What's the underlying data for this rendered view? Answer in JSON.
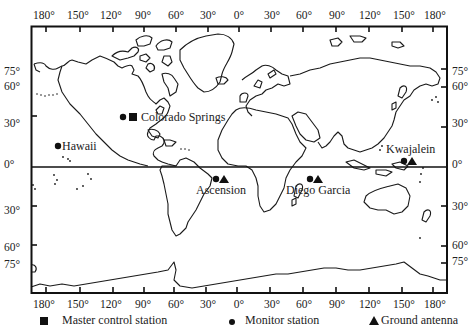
{
  "map": {
    "longitude_labels": [
      "180°",
      "150°",
      "120°",
      "90°",
      "60°",
      "30°",
      "0°",
      "30°",
      "60°",
      "90°",
      "120°",
      "150°",
      "180°"
    ],
    "latitude_labels_left": [
      {
        "label": "75°",
        "y": 72
      },
      {
        "label": "60°",
        "y": 87
      },
      {
        "label": "30°",
        "y": 124
      },
      {
        "label": "0°",
        "y": 165
      },
      {
        "label": "30°",
        "y": 211
      },
      {
        "label": "60°",
        "y": 248
      },
      {
        "label": "75°",
        "y": 265
      }
    ],
    "latitude_labels_right": [
      {
        "label": "75°",
        "y": 72
      },
      {
        "label": "60°",
        "y": 87
      },
      {
        "label": "30°",
        "y": 124
      },
      {
        "label": "0°",
        "y": 165
      },
      {
        "label": "30°",
        "y": 207
      },
      {
        "label": "60°",
        "y": 246
      },
      {
        "label": "75°",
        "y": 262
      }
    ],
    "stations": [
      {
        "name": "Colorado Springs",
        "types": [
          "monitor",
          "master"
        ]
      },
      {
        "name": "Hawaii",
        "types": [
          "monitor"
        ]
      },
      {
        "name": "Ascension",
        "types": [
          "monitor",
          "antenna"
        ]
      },
      {
        "name": "Diego Garcia",
        "types": [
          "monitor",
          "antenna"
        ]
      },
      {
        "name": "Kwajalein",
        "types": [
          "monitor",
          "antenna"
        ]
      }
    ]
  },
  "legend": {
    "master": "Master control station",
    "monitor": "Monitor station",
    "antenna": "Ground antenna"
  }
}
